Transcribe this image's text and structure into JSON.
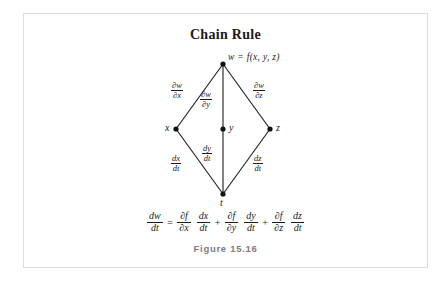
{
  "page": {
    "top_clipped_text": [
      "",
      "",
      "",
      "",
      ""
    ]
  },
  "figure": {
    "title": "Chain Rule",
    "caption": "Figure 15.16"
  },
  "diagram": {
    "type": "dependency-tree",
    "nodes": [
      {
        "id": "w",
        "label": "w = f(x,  y,  z)",
        "x": 222,
        "y": 62,
        "label_pos": "right"
      },
      {
        "id": "x",
        "label": "x",
        "x": 175,
        "y": 127,
        "label_pos": "left"
      },
      {
        "id": "y",
        "label": "y",
        "x": 222,
        "y": 127,
        "label_pos": "right"
      },
      {
        "id": "z",
        "label": "z",
        "x": 268,
        "y": 127,
        "label_pos": "right"
      },
      {
        "id": "t",
        "label": "t",
        "x": 222,
        "y": 192,
        "label_pos": "below"
      }
    ],
    "edges": [
      {
        "from": "w",
        "to": "x",
        "num": "∂w",
        "den": "∂x"
      },
      {
        "from": "w",
        "to": "y",
        "num": "∂w",
        "den": "∂y"
      },
      {
        "from": "w",
        "to": "z",
        "num": "∂w",
        "den": "∂z"
      },
      {
        "from": "x",
        "to": "t",
        "num": "dx",
        "den": "dt"
      },
      {
        "from": "y",
        "to": "t",
        "num": "dy",
        "den": "dt"
      },
      {
        "from": "z",
        "to": "t",
        "num": "dz",
        "den": "dt"
      }
    ]
  },
  "equation": {
    "lhs": {
      "num": "dw",
      "den": "dt"
    },
    "equals": "=",
    "terms": [
      {
        "a": {
          "num": "∂f",
          "den": "∂x"
        },
        "b": {
          "num": "dx",
          "den": "dt"
        }
      },
      {
        "a": {
          "num": "∂f",
          "den": "∂y"
        },
        "b": {
          "num": "dy",
          "den": "dt"
        }
      },
      {
        "a": {
          "num": "∂f",
          "den": "∂z"
        },
        "b": {
          "num": "dz",
          "den": "dt"
        }
      }
    ],
    "plus": "+"
  },
  "colors": {
    "ink": "#1b1b1b",
    "border": "#dcdcde",
    "caption": "#7c7c80",
    "background": "#ffffff"
  }
}
